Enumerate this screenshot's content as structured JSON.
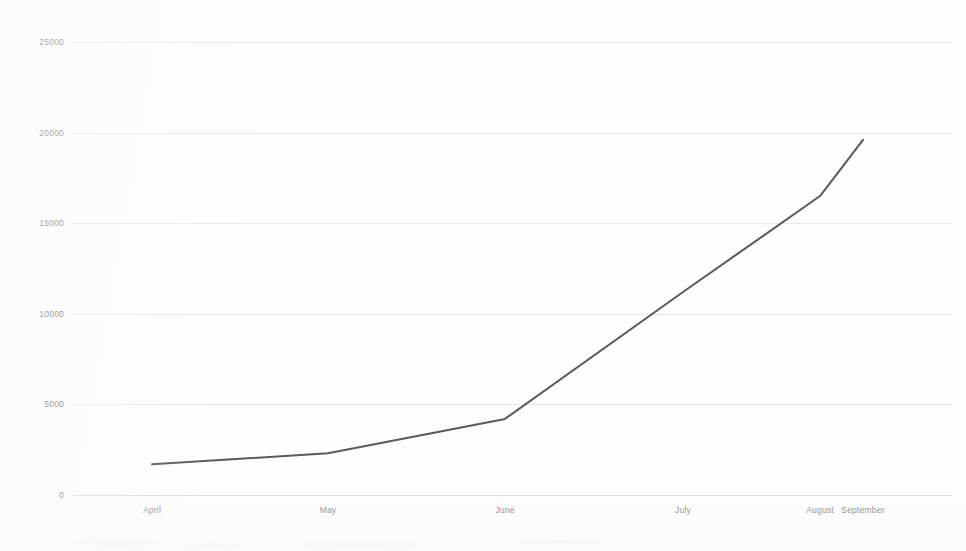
{
  "chart_data": {
    "type": "line",
    "title": "",
    "subtitle": "",
    "xlabel": "",
    "ylabel": "",
    "categories": [
      "April",
      "May",
      "June",
      "July",
      "August",
      "September"
    ],
    "values": [
      1700,
      2300,
      4200,
      11200,
      16500,
      19600
    ],
    "series": [
      {
        "name": "",
        "values": [
          1700,
          2300,
          4200,
          11200,
          16500,
          19600
        ]
      }
    ],
    "ylim": [
      0,
      25000
    ],
    "ytick_labels": [
      "0",
      "5000",
      "10000",
      "15000",
      "20000",
      "25000"
    ],
    "ytick_values": [
      0,
      5000,
      10000,
      15000,
      20000,
      25000
    ],
    "xtick_labels": [
      "April",
      "May",
      "June",
      "July",
      "August",
      "September"
    ],
    "grid": true,
    "grid_axis": "y",
    "legend": false,
    "legend_position": "none",
    "annotations": [],
    "line_color": "#5a5a5a",
    "grid_color": "#e9e9ea",
    "axis_color": "#d9d9db",
    "text_color": "#6e6e70",
    "background_color": "#fdfdfd",
    "markers": false
  }
}
